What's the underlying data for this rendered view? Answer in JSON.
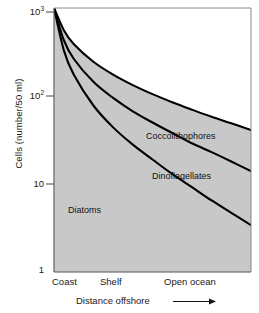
{
  "chart_data": {
    "type": "area",
    "title": "",
    "subtitle": "",
    "xlabel": "Distance offshore",
    "ylabel": "Cells (number/50 ml)",
    "yscale": "log",
    "ylim": [
      1,
      1000
    ],
    "ytick_labels": [
      "10³",
      "10²",
      "10",
      "1"
    ],
    "ytick_values": [
      1000,
      100,
      10,
      1
    ],
    "xtick_labels": [
      "Coast",
      "Shelf",
      "Open ocean"
    ],
    "xlim": [
      0,
      100
    ],
    "grid": false,
    "legend": "inline-annotations",
    "fill_color": "#c8c8c8",
    "line_color": "#000000",
    "x": [
      0,
      5,
      10,
      20,
      30,
      40,
      50,
      60,
      70,
      80,
      90,
      100
    ],
    "series": [
      {
        "name": "Coccolithophores",
        "note": "upper boundary curve",
        "values": [
          1000,
          560,
          390,
          245,
          175,
          133,
          105,
          85,
          70,
          58,
          49,
          41
        ]
      },
      {
        "name": "Dinoflagellates",
        "note": "middle boundary curve",
        "values": [
          1000,
          430,
          265,
          145,
          95,
          67,
          50,
          38,
          29,
          23,
          18,
          14
        ]
      },
      {
        "name": "Diatoms",
        "note": "lower boundary curve",
        "values": [
          1000,
          330,
          175,
          78,
          44,
          28,
          19,
          13,
          9.2,
          6.5,
          4.7,
          3.4
        ]
      }
    ],
    "annotations": [
      {
        "text": "Coccolithophores",
        "x": 50,
        "y": 46
      },
      {
        "text": "Dinoflagellates",
        "x": 53,
        "y": 16
      },
      {
        "text": "Diatoms",
        "x": 12,
        "y": 4.6
      }
    ]
  },
  "axis": {
    "y_title": "Cells (number/50 ml)",
    "x_title": "Distance offshore",
    "arrow": "⟶"
  },
  "ticks": {
    "y": [
      {
        "label_main": "10",
        "label_exp": "3"
      },
      {
        "label_main": "10",
        "label_exp": "2"
      },
      {
        "label_main": "10",
        "label_exp": ""
      },
      {
        "label_main": "1",
        "label_exp": ""
      }
    ],
    "x": [
      "Coast",
      "Shelf",
      "Open ocean"
    ]
  },
  "labels": {
    "coccolithophores": "Coccolithophores",
    "dinoflagellates": "Dinoflagellates",
    "diatoms": "Diatoms"
  }
}
